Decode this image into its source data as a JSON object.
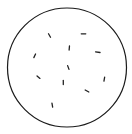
{
  "diagram": {
    "type": "circle-with-particles",
    "width": 132,
    "height": 134,
    "circle": {
      "cx": 67,
      "cy": 67.5,
      "r": 59.5,
      "stroke": "#1a1a1a",
      "stroke_width": 1.2
    },
    "particle_color": "#222222",
    "particles": [
      {
        "x": 49.5,
        "y": 35.5,
        "angle": -60,
        "len": 4
      },
      {
        "x": 83.5,
        "y": 33.8,
        "angle": 0,
        "len": 4.5
      },
      {
        "x": 69.3,
        "y": 48.0,
        "angle": 85,
        "len": 4
      },
      {
        "x": 97.8,
        "y": 52.2,
        "angle": -8,
        "len": 4.5
      },
      {
        "x": 34.7,
        "y": 55.8,
        "angle": 65,
        "len": 4
      },
      {
        "x": 68.3,
        "y": 67.5,
        "angle": -70,
        "len": 4
      },
      {
        "x": 38.5,
        "y": 77.2,
        "angle": -40,
        "len": 3.8
      },
      {
        "x": 63.3,
        "y": 82.5,
        "angle": 90,
        "len": 4
      },
      {
        "x": 104.3,
        "y": 79.2,
        "angle": 80,
        "len": 4
      },
      {
        "x": 87.0,
        "y": 91.0,
        "angle": -30,
        "len": 4.2
      },
      {
        "x": 52.3,
        "y": 105.2,
        "angle": -80,
        "len": 4
      }
    ]
  }
}
